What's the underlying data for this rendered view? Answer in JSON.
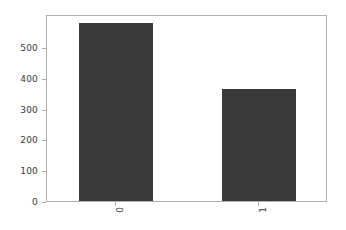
{
  "chart_data": {
    "type": "bar",
    "title": "",
    "xlabel": "",
    "ylabel": "",
    "categories": [
      "0",
      "1"
    ],
    "values": [
      585,
      367
    ],
    "ylim": [
      0,
      608
    ],
    "yticks": [
      0,
      100,
      200,
      300,
      400,
      500
    ],
    "ytick_labels": [
      "0",
      "100",
      "200",
      "300",
      "400",
      "500"
    ],
    "xtick_labels": [
      "0",
      "1"
    ],
    "xtick_rotation": 90,
    "grid": false,
    "legend": null,
    "bar_color": "#3a3a3a",
    "background_color": "#ffffff",
    "axes_color": "#b0b0b0",
    "tick_label_color": "#3b3b3b"
  }
}
